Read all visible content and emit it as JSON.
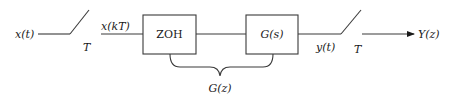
{
  "diagram": {
    "type": "sampled-data block diagram",
    "input": {
      "signal_label": "x(t)"
    },
    "input_sampler": {
      "period_label": "T",
      "output_label": "x(kT)"
    },
    "blocks": [
      {
        "id": "zoh",
        "label": "ZOH"
      },
      {
        "id": "plant",
        "label": "G(s)"
      }
    ],
    "plant_output": {
      "signal_label": "y(t)"
    },
    "output_sampler": {
      "period_label": "T"
    },
    "output": {
      "signal_label": "Y(z)"
    },
    "grouping_brace": {
      "label": "G(z)",
      "spans": [
        "zoh",
        "plant"
      ]
    },
    "colors": {
      "stroke": "#3a3a3a",
      "text": "#1a1a1a",
      "background": "#ffffff"
    }
  }
}
